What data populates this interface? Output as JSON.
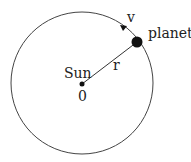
{
  "diagram": {
    "title": "",
    "labels": {
      "velocity": "v",
      "planet": "planet",
      "sun": "Sun",
      "origin": "0",
      "radius": "r"
    },
    "colors": {
      "stroke": "#333333",
      "fill": "#111111",
      "background": "#ffffff"
    }
  }
}
